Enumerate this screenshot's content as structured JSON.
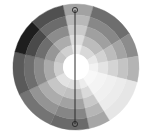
{
  "wheel": {
    "center": [
      76,
      67
    ],
    "outer_radius": 63,
    "ring_radii": [
      63,
      52,
      42,
      32,
      22,
      13
    ],
    "center_color": "#ffffff",
    "sectors": [
      {
        "start": -12,
        "end": 16,
        "colors": [
          "#a2a2a2",
          "#b8b8b8",
          "#cacaca",
          "#dcdcdc",
          "#ececec"
        ]
      },
      {
        "start": 16,
        "end": 58,
        "colors": [
          "#6e6e6e",
          "#888888",
          "#a0a0a0",
          "#bcbcbc",
          "#d8d8d8"
        ]
      },
      {
        "start": 58,
        "end": 80,
        "colors": [
          "#8c8c8c",
          "#a4a4a4",
          "#bcbcbc",
          "#d2d2d2",
          "#e8e8e8"
        ]
      },
      {
        "start": 80,
        "end": 104,
        "colors": [
          "#b4b4b4",
          "#c4c4c4",
          "#d4d4d4",
          "#e4e4e4",
          "#f2f2f2"
        ]
      },
      {
        "start": 104,
        "end": 148,
        "colors": [
          "#e6e6e6",
          "#ececec",
          "#f0f0f0",
          "#f4f4f4",
          "#f8f8f8"
        ]
      },
      {
        "start": 148,
        "end": 168,
        "colors": [
          "#a6a6a6",
          "#b6b6b6",
          "#c8c8c8",
          "#dadada",
          "#ececec"
        ]
      },
      {
        "start": 168,
        "end": 204,
        "colors": [
          "#6a6a6a",
          "#868686",
          "#a2a2a2",
          "#c0c0c0",
          "#dedede"
        ]
      },
      {
        "start": 204,
        "end": 244,
        "colors": [
          "#747474",
          "#949494",
          "#acacac",
          "#c6c6c6",
          "#e2e2e2"
        ]
      },
      {
        "start": 244,
        "end": 284,
        "colors": [
          "#5a5a5a",
          "#6e6e6e",
          "#8a8a8a",
          "#aaaaaa",
          "#cecece"
        ]
      },
      {
        "start": 284,
        "end": 316,
        "colors": [
          "#1e1e1e",
          "#4a4a4a",
          "#6e6e6e",
          "#969696",
          "#c4c4c4"
        ]
      },
      {
        "start": 316,
        "end": 348,
        "colors": [
          "#505050",
          "#6c6c6c",
          "#8c8c8c",
          "#acacac",
          "#d0d0d0"
        ]
      }
    ]
  },
  "axis_line": {
    "x": 75,
    "y1": 10,
    "y2": 124,
    "color": "#2a2a2a",
    "handle_radius": 2.6
  }
}
